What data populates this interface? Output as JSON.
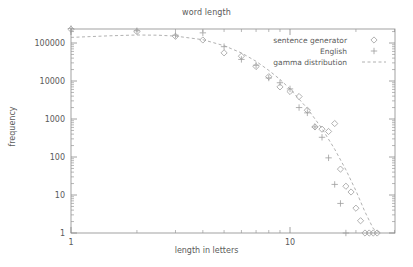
{
  "chart_data": {
    "type": "scatter",
    "title": "word length",
    "xlabel": "length in letters",
    "ylabel": "frequency",
    "xscale": "log",
    "yscale": "log",
    "xlim": [
      1,
      30
    ],
    "ylim": [
      1,
      300000
    ],
    "xticks": [
      "1",
      "10"
    ],
    "xtick_values": [
      1,
      10
    ],
    "yticks": [
      "1",
      "10",
      "100",
      "1000",
      "10000",
      "100000"
    ],
    "ytick_values": [
      1,
      10,
      100,
      1000,
      10000,
      100000
    ],
    "grid": false,
    "legend_position": "top-right",
    "series": [
      {
        "name": "sentence generator",
        "marker": "diamond",
        "x": [
          1,
          2,
          3,
          4,
          5,
          6,
          7,
          8,
          9,
          10,
          11,
          12,
          13,
          14,
          15,
          16,
          17,
          18,
          19,
          20,
          21,
          22,
          23,
          24,
          25
        ],
        "values": [
          230000,
          200000,
          150000,
          120000,
          55000,
          45000,
          24000,
          13000,
          7000,
          5300,
          3900,
          1700,
          620,
          540,
          470,
          760,
          48,
          17,
          12,
          4.5,
          2.1,
          1,
          1,
          1,
          1
        ]
      },
      {
        "name": "English",
        "marker": "plus",
        "x": [
          1,
          2,
          3,
          4,
          5,
          6,
          7,
          8,
          9,
          10,
          11,
          12,
          13,
          14,
          15,
          16,
          17,
          18
        ],
        "values": [
          240000,
          210000,
          160000,
          185000,
          80000,
          37000,
          26000,
          12000,
          9000,
          6200,
          2000,
          1450,
          620,
          330,
          95,
          19,
          6,
          1
        ]
      },
      {
        "name": "gamma distribution",
        "marker": "dashed-line",
        "x": [
          1,
          1.5,
          2,
          2.5,
          3,
          4,
          5,
          6,
          7,
          8,
          9,
          10,
          12,
          14,
          16,
          18,
          20,
          22,
          24,
          26
        ],
        "values": [
          140000,
          155000,
          162000,
          160000,
          152000,
          122000,
          85000,
          55000,
          33000,
          19000,
          11000,
          6200,
          1900,
          560,
          160,
          46,
          13,
          3.6,
          1.3,
          1
        ]
      }
    ]
  },
  "legend": {
    "items": [
      {
        "label": "sentence generator",
        "marker": "diamond"
      },
      {
        "label": "English",
        "marker": "plus"
      },
      {
        "label": "gamma distribution",
        "marker": "dashed-line"
      }
    ]
  }
}
